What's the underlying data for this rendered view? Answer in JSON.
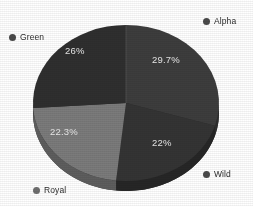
{
  "chart_data": {
    "type": "pie",
    "title": "",
    "subtitle": "",
    "xlabel": "",
    "ylabel": "",
    "legend_position": "around-perimeter",
    "grid": false,
    "three_d": true,
    "categories": [
      "Alpha",
      "Wild",
      "Royal",
      "Green"
    ],
    "values": [
      29.7,
      22,
      22.3,
      26
    ],
    "data_labels": [
      "29.7%",
      "22%",
      "22.3%",
      "26%"
    ],
    "slices": [
      {
        "name": "Alpha",
        "value": 29.7,
        "label": "29.7%",
        "color": "#3d3d3d",
        "side_color": "#2e2e2e"
      },
      {
        "name": "Wild",
        "value": 22.0,
        "label": "22%",
        "color": "#343434",
        "side_color": "#262626"
      },
      {
        "name": "Royal",
        "value": 22.3,
        "label": "22.3%",
        "color": "#7b7b7b",
        "side_color": "#5e5e5e"
      },
      {
        "name": "Green",
        "value": 26.0,
        "label": "26%",
        "color": "#2f2f2f",
        "side_color": "#242424"
      }
    ],
    "legend": [
      {
        "label": "Alpha",
        "marker_color": "#4a4a4a"
      },
      {
        "label": "Green",
        "marker_color": "#4a4a4a"
      },
      {
        "label": "Wild",
        "marker_color": "#4a4a4a"
      },
      {
        "label": "Royal",
        "marker_color": "#6f6f6f"
      }
    ]
  },
  "colors": {
    "background": "#ffffff",
    "label_text": "#e9e9e9",
    "legend_text": "#2b2b2b",
    "alpha": "#3d3d3d",
    "wild": "#343434",
    "royal": "#7b7b7b",
    "green": "#2f2f2f"
  }
}
